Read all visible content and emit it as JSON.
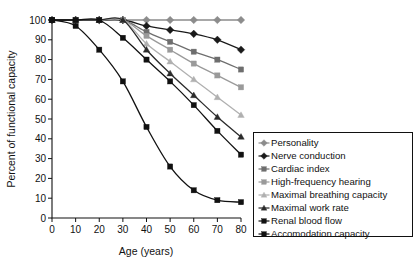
{
  "chart_data": {
    "type": "line",
    "title": "",
    "xlabel": "Age (years)",
    "ylabel": "Percent of functional capacity",
    "xlim": [
      0,
      80
    ],
    "ylim": [
      0,
      100
    ],
    "xticks": [
      0,
      10,
      20,
      30,
      40,
      50,
      60,
      70,
      80
    ],
    "yticks": [
      0,
      10,
      20,
      30,
      40,
      50,
      60,
      70,
      80,
      90,
      100
    ],
    "grid": false,
    "legend_position": "right-bottom-inset",
    "x": [
      0,
      10,
      20,
      30,
      40,
      50,
      60,
      70,
      80
    ],
    "series": [
      {
        "name": "Personality",
        "values": [
          100,
          100,
          100,
          100,
          100,
          100,
          100,
          100,
          100
        ],
        "color": "#8c8c8c",
        "marker": "diamond"
      },
      {
        "name": "Nerve conduction",
        "values": [
          100,
          100,
          100,
          100,
          97,
          95,
          93,
          90,
          85
        ],
        "color": "#1a1a1a",
        "marker": "diamond"
      },
      {
        "name": "Cardiac index",
        "values": [
          100,
          100,
          100,
          100,
          94,
          89,
          84,
          80,
          75
        ],
        "color": "#6e6e6e",
        "marker": "square"
      },
      {
        "name": "High-frequency hearing",
        "values": [
          100,
          100,
          100,
          100,
          92,
          85,
          78,
          72,
          66
        ],
        "color": "#9a9a9a",
        "marker": "square"
      },
      {
        "name": "Maximal breathing capacity",
        "values": [
          100,
          100,
          100,
          100,
          88,
          79,
          70,
          61,
          52
        ],
        "color": "#b0b0b0",
        "marker": "triangle"
      },
      {
        "name": "Maximal work rate",
        "values": [
          100,
          100,
          100,
          100,
          85,
          73,
          62,
          51,
          41
        ],
        "color": "#2b2b2b",
        "marker": "triangle"
      },
      {
        "name": "Renal blood flow",
        "values": [
          100,
          100,
          100,
          91,
          80,
          69,
          57,
          44,
          32
        ],
        "color": "#111111",
        "marker": "square"
      },
      {
        "name": "Accomodation capacity",
        "values": [
          100,
          97,
          85,
          69,
          46,
          26,
          14,
          9,
          8
        ],
        "color": "#111111",
        "marker": "square"
      }
    ]
  }
}
